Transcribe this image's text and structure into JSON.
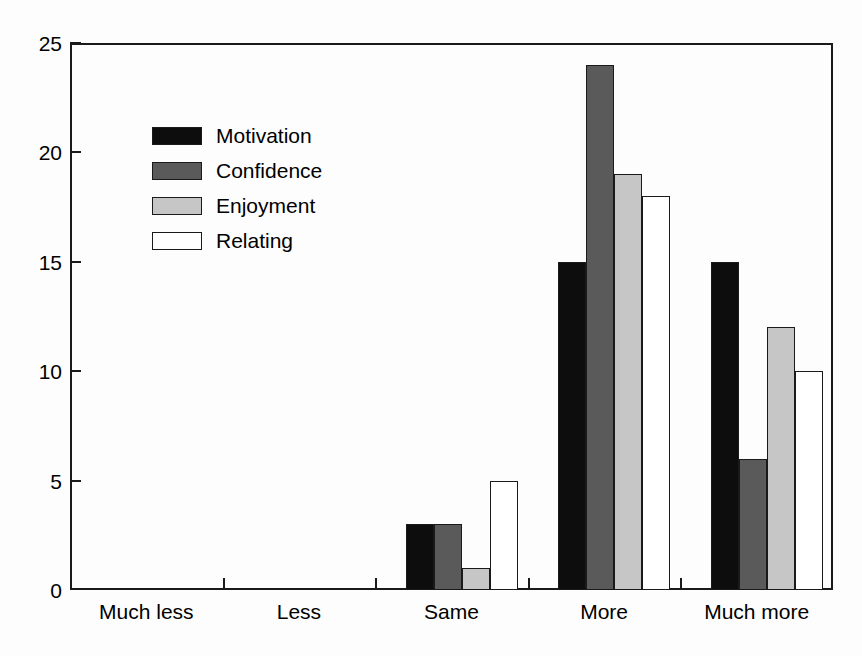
{
  "chart_data": {
    "type": "bar",
    "title": "",
    "subtitle": "",
    "xlabel": "",
    "ylabel": "",
    "categories": [
      "Much less",
      "Less",
      "Same",
      "More",
      "Much more"
    ],
    "series": [
      {
        "name": "Motivation",
        "color": "#0d0d0d",
        "values": [
          0,
          0,
          3,
          15,
          15
        ]
      },
      {
        "name": "Confidence",
        "color": "#5a5a5a",
        "values": [
          0,
          0,
          3,
          24,
          6
        ]
      },
      {
        "name": "Enjoyment",
        "color": "#c6c6c6",
        "values": [
          0,
          0,
          1,
          19,
          12
        ]
      },
      {
        "name": "Relating",
        "color": "#ffffff",
        "values": [
          0,
          0,
          5,
          18,
          10
        ]
      }
    ],
    "ylim": [
      0,
      25
    ],
    "yticks": [
      0,
      5,
      10,
      15,
      20,
      25
    ],
    "ytick_labels": [
      "0",
      "5",
      "10",
      "15",
      "20",
      "25"
    ],
    "grid": false,
    "legend_position": "upper-left-inside",
    "axis_color": "#1a1a1a",
    "background_color": "#ffffff"
  },
  "legend": {
    "entries": [
      {
        "label": "Motivation"
      },
      {
        "label": "Confidence"
      },
      {
        "label": "Enjoyment"
      },
      {
        "label": "Relating"
      }
    ]
  }
}
